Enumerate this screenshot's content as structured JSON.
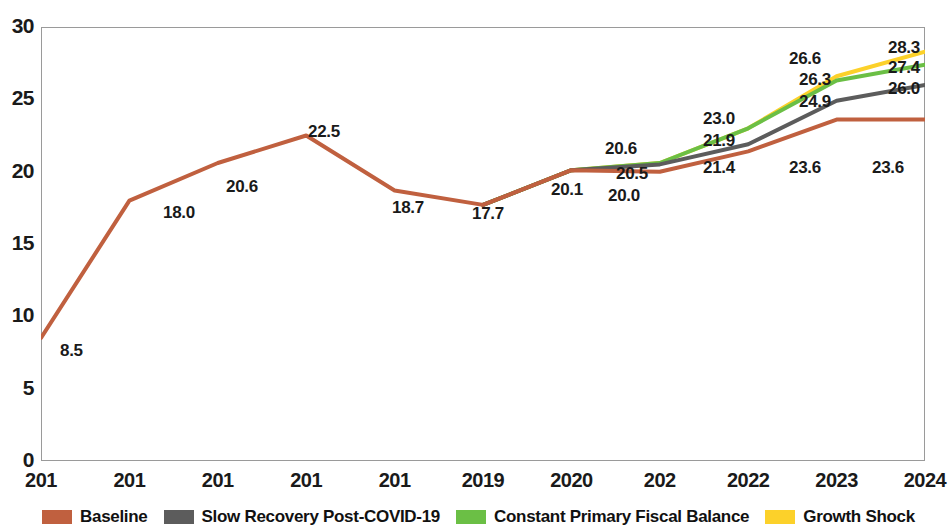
{
  "chart_data": {
    "type": "line",
    "title": "",
    "subtitle": "",
    "xlabel": "",
    "ylabel": "",
    "x": [
      "201",
      "201",
      "201",
      "201",
      "201",
      "2019",
      "2020",
      "202",
      "2022",
      "2023",
      "2024"
    ],
    "categories": [
      "201",
      "201",
      "201",
      "201",
      "201",
      "2019",
      "2020",
      "202",
      "2022",
      "2023",
      "2024"
    ],
    "ylim": [
      0,
      30
    ],
    "yticks": [
      "0",
      "5",
      "10",
      "15",
      "20",
      "25",
      "30"
    ],
    "ytick_values": [
      0,
      5,
      10,
      15,
      20,
      25,
      30
    ],
    "grid": false,
    "legend_position": "bottom",
    "series": [
      {
        "name": "Baseline",
        "color": "#c0603f",
        "values": [
          8.5,
          18.0,
          20.6,
          22.5,
          18.7,
          17.7,
          20.1,
          20.0,
          21.4,
          23.6,
          23.6
        ],
        "labels": [
          "8.5",
          "18.0",
          "20.6",
          "22.5",
          "18.7",
          "17.7",
          null,
          "20.0",
          "21.4",
          "23.6",
          "23.6"
        ]
      },
      {
        "name": "Slow Recovery Post-COVID-19",
        "color": "#5c5c5c",
        "values": [
          null,
          null,
          null,
          null,
          null,
          17.7,
          20.1,
          20.5,
          21.9,
          24.9,
          26.0
        ],
        "labels": [
          null,
          null,
          null,
          null,
          null,
          null,
          null,
          "20.5",
          "21.9",
          "24.9",
          "26.0"
        ]
      },
      {
        "name": "Constant Primary Fiscal Balance",
        "color": "#6bbf45",
        "values": [
          null,
          null,
          null,
          null,
          null,
          17.7,
          20.1,
          20.6,
          23.0,
          26.3,
          27.4
        ],
        "labels": [
          null,
          null,
          null,
          null,
          null,
          null,
          null,
          null,
          null,
          "26.3",
          "27.4"
        ]
      },
      {
        "name": "Growth Shock",
        "color": "#fcd12a",
        "values": [
          null,
          null,
          null,
          null,
          null,
          17.7,
          20.1,
          20.6,
          23.0,
          26.6,
          28.3
        ],
        "labels": [
          null,
          null,
          null,
          null,
          null,
          "17.7",
          "20.1",
          "20.6",
          "23.0",
          "26.6",
          "28.3"
        ]
      }
    ],
    "data_labels": [
      {
        "text": "8.5",
        "x": 60,
        "y": 341
      },
      {
        "text": "18.0",
        "x": 163,
        "y": 203
      },
      {
        "text": "20.6",
        "x": 226,
        "y": 177
      },
      {
        "text": "22.5",
        "x": 308,
        "y": 122
      },
      {
        "text": "18.7",
        "x": 392,
        "y": 198
      },
      {
        "text": "17.7",
        "x": 472,
        "y": 204
      },
      {
        "text": "20.1",
        "x": 551,
        "y": 180
      },
      {
        "text": "20.6",
        "x": 605,
        "y": 139
      },
      {
        "text": "20.5",
        "x": 616,
        "y": 164
      },
      {
        "text": "20.0",
        "x": 608,
        "y": 186
      },
      {
        "text": "23.0",
        "x": 703,
        "y": 109
      },
      {
        "text": "21.9",
        "x": 703,
        "y": 131
      },
      {
        "text": "21.4",
        "x": 703,
        "y": 158
      },
      {
        "text": "26.6",
        "x": 789,
        "y": 49
      },
      {
        "text": "26.3",
        "x": 799,
        "y": 70
      },
      {
        "text": "24.9",
        "x": 799,
        "y": 92
      },
      {
        "text": "23.6",
        "x": 789,
        "y": 158
      },
      {
        "text": "28.3",
        "x": 888,
        "y": 38
      },
      {
        "text": "27.4",
        "x": 888,
        "y": 58
      },
      {
        "text": "26.0",
        "x": 888,
        "y": 79
      },
      {
        "text": "23.6",
        "x": 872,
        "y": 158
      }
    ]
  },
  "legend": {
    "items": [
      {
        "label": "Baseline",
        "color": "#c0603f"
      },
      {
        "label": "Slow Recovery Post-COVID-19",
        "color": "#5c5c5c"
      },
      {
        "label": "Constant Primary Fiscal Balance",
        "color": "#6bbf45"
      },
      {
        "label": "Growth Shock",
        "color": "#fcd12a"
      }
    ]
  },
  "axes": {
    "y_ticks": [
      "30",
      "25",
      "20",
      "15",
      "10",
      "5",
      "0"
    ],
    "x_ticks": [
      "201",
      "201",
      "201",
      "201",
      "201",
      "2019",
      "2020",
      "202",
      "2022",
      "2023",
      "2024"
    ]
  }
}
